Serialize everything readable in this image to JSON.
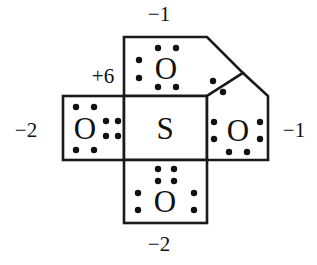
{
  "diagram": {
    "type": "lewis-structure",
    "stroke_color": "#1a1a1a",
    "fill_color": "#ffffff",
    "dot_color": "#111111",
    "central_atom": {
      "symbol": "S",
      "name": "sulfur",
      "formal_charge": "+6",
      "lone_pairs": 0,
      "dots": 0
    },
    "atoms": [
      {
        "id": "oxygen-top",
        "symbol": "O",
        "position": "top",
        "formal_charge": "-1",
        "dot_groups": [
          {
            "side": "top",
            "count": 2
          },
          {
            "side": "bottom",
            "count": 2
          },
          {
            "side": "left",
            "count": 2
          }
        ],
        "shape": "beveled-top-right"
      },
      {
        "id": "oxygen-left",
        "symbol": "O",
        "position": "left",
        "formal_charge": "-2",
        "dot_groups": [
          {
            "side": "top",
            "count": 2
          },
          {
            "side": "bottom",
            "count": 2
          },
          {
            "side": "right",
            "count": 4
          }
        ],
        "shape": "rectangle"
      },
      {
        "id": "oxygen-right",
        "symbol": "O",
        "position": "right",
        "formal_charge": "-1",
        "dot_groups": [
          {
            "side": "left",
            "count": 2
          },
          {
            "side": "right",
            "count": 2
          },
          {
            "side": "bottom",
            "count": 2
          }
        ],
        "shape": "beveled-top-left"
      },
      {
        "id": "oxygen-bottom",
        "symbol": "O",
        "position": "bottom",
        "formal_charge": "-2",
        "dot_groups": [
          {
            "side": "top",
            "count": 4
          },
          {
            "side": "left",
            "count": 2
          },
          {
            "side": "right",
            "count": 2
          }
        ],
        "shape": "rectangle"
      }
    ],
    "shared_pair": {
      "between": [
        "oxygen-top",
        "oxygen-right"
      ],
      "dots": 2,
      "label": "shared-electron-pair"
    },
    "labels": {
      "top": "−1",
      "bottom": "−2",
      "left": "−2",
      "right": "−1",
      "center": "+6"
    },
    "symbols": {
      "sulfur": "S",
      "oxygen_top": "O",
      "oxygen_left": "O",
      "oxygen_right": "O",
      "oxygen_bottom": "O"
    }
  }
}
